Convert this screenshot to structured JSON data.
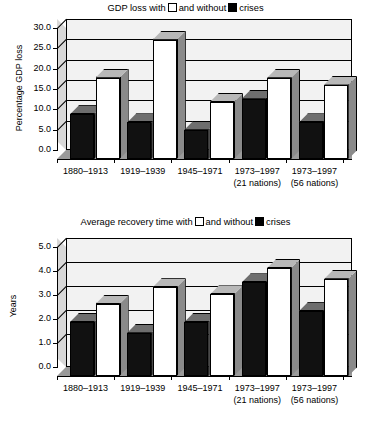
{
  "chart_data": [
    {
      "type": "bar",
      "title": "GDP loss with □ and without ■ crises",
      "title_prefix": "GDP loss with",
      "title_middle": "and without",
      "title_suffix": "crises",
      "xlabel": "",
      "ylabel": "Percentage GDP loss",
      "ylim": [
        0.0,
        30.0
      ],
      "yticks": [
        "0.0",
        "5.0",
        "10.0",
        "15.0",
        "20.0",
        "25.0",
        "30.0"
      ],
      "ytick_values": [
        0.0,
        5.0,
        10.0,
        15.0,
        20.0,
        25.0,
        30.0
      ],
      "grid": true,
      "legend_position": "title",
      "categories": [
        "1880–1913",
        "1919–1939",
        "1945–1971",
        "1973–1997",
        "1973–1997"
      ],
      "categories_sub": [
        "",
        "",
        "",
        "(21 nations)",
        "(56 nations)"
      ],
      "series": [
        {
          "name": "without crises",
          "swatch": "black",
          "color": "#111111",
          "values": [
            11.0,
            9.0,
            7.2,
            14.8,
            9.0
          ]
        },
        {
          "name": "with crises",
          "swatch": "white",
          "color": "#ffffff",
          "values": [
            20.0,
            29.3,
            14.0,
            20.0,
            18.3
          ]
        }
      ]
    },
    {
      "type": "bar",
      "title": "Average recovery time with □ and without ■ crises",
      "title_prefix": "Average recovery time with",
      "title_middle": "and without",
      "title_suffix": "crises",
      "xlabel": "",
      "ylabel": "Years",
      "ylim": [
        0.0,
        5.0
      ],
      "yticks": [
        "0.0",
        "1.0",
        "2.0",
        "3.0",
        "4.0",
        "5.0"
      ],
      "ytick_values": [
        0.0,
        1.0,
        2.0,
        3.0,
        4.0,
        5.0
      ],
      "grid": true,
      "legend_position": "title",
      "categories": [
        "1880–1913",
        "1919–1939",
        "1945–1971",
        "1973–1997",
        "1973–1997"
      ],
      "categories_sub": [
        "",
        "",
        "",
        "(21 nations)",
        "(56 nations)"
      ],
      "series": [
        {
          "name": "without crises",
          "swatch": "black",
          "color": "#111111",
          "values": [
            2.25,
            1.8,
            2.25,
            3.9,
            2.7
          ]
        },
        {
          "name": "with crises",
          "swatch": "white",
          "color": "#ffffff",
          "values": [
            3.0,
            3.7,
            3.4,
            4.5,
            4.05
          ]
        }
      ]
    }
  ]
}
